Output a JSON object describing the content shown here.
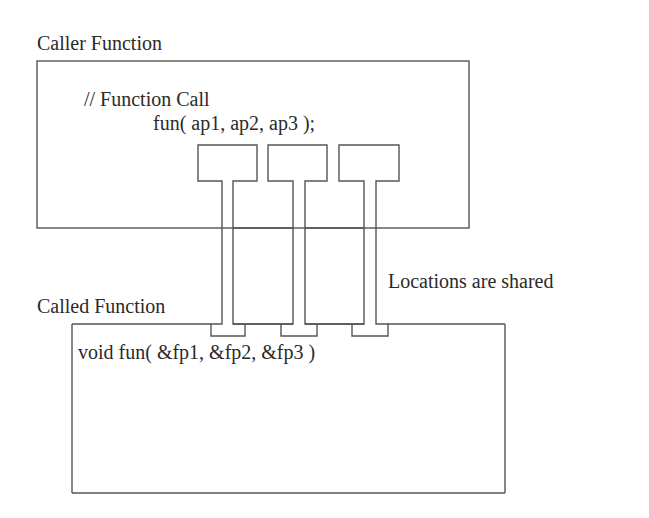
{
  "caller": {
    "title": "Caller Function",
    "comment": "// Function Call",
    "call": "fun( ap1, ap2, ap3 );",
    "actual_params": [
      "ap1",
      "ap2",
      "ap3"
    ]
  },
  "called": {
    "title": "Called Function",
    "signature": "void fun( &fp1, &fp2, &fp3 )",
    "formal_params": [
      "&fp1",
      "&fp2",
      "&fp3"
    ]
  },
  "annotation": "Locations are shared",
  "colors": {
    "stroke": "#555555",
    "text": "#2a2a2a",
    "background": "#ffffff"
  }
}
